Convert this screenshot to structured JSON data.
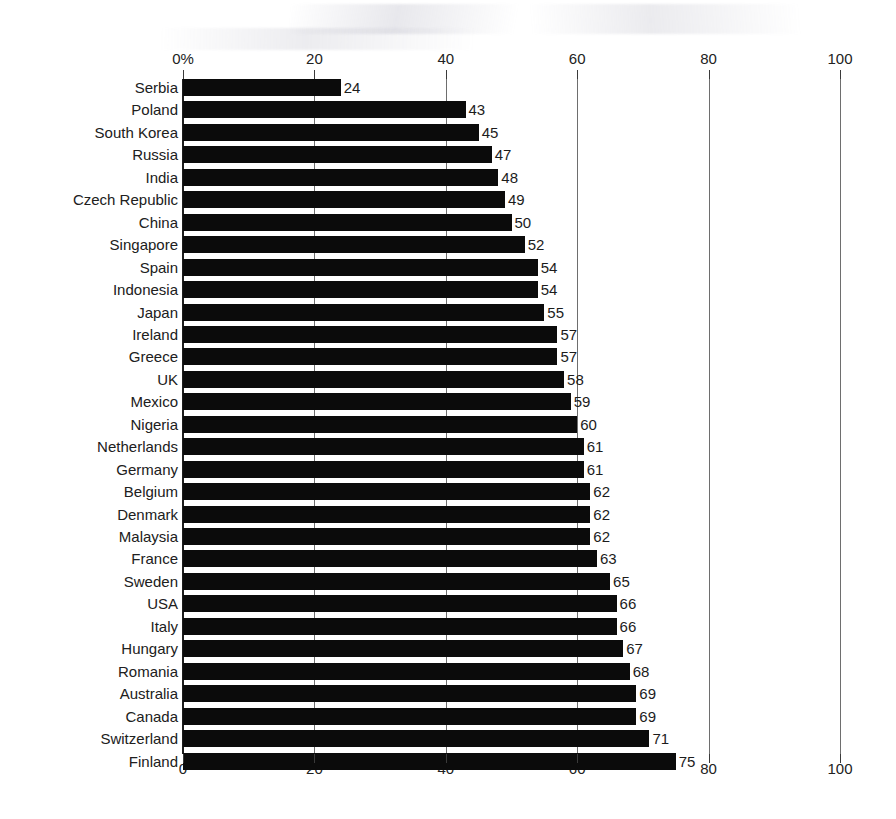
{
  "chart_data": {
    "type": "bar",
    "orientation": "horizontal",
    "title": "",
    "subtitle": "",
    "xlabel": "",
    "ylabel": "",
    "xlim": [
      0,
      100
    ],
    "grid": true,
    "legend": null,
    "axis_top_ticks": [
      "0%",
      "20",
      "40",
      "60",
      "80",
      "100"
    ],
    "axis_bottom_ticks": [
      "0",
      "20",
      "40",
      "60",
      "80",
      "100"
    ],
    "tick_values": [
      0,
      20,
      40,
      60,
      80,
      100
    ],
    "categories": [
      "Serbia",
      "Poland",
      "South Korea",
      "Russia",
      "India",
      "Czech Republic",
      "China",
      "Singapore",
      "Spain",
      "Indonesia",
      "Japan",
      "Ireland",
      "Greece",
      "UK",
      "Mexico",
      "Nigeria",
      "Netherlands",
      "Germany",
      "Belgium",
      "Denmark",
      "Malaysia",
      "France",
      "Sweden",
      "USA",
      "Italy",
      "Hungary",
      "Romania",
      "Australia",
      "Canada",
      "Switzerland",
      "Finland"
    ],
    "values": [
      24,
      43,
      45,
      47,
      48,
      49,
      50,
      52,
      54,
      54,
      55,
      57,
      57,
      58,
      59,
      60,
      61,
      61,
      62,
      62,
      62,
      63,
      65,
      66,
      66,
      67,
      68,
      69,
      69,
      71,
      75
    ],
    "value_labels": [
      "24",
      "43",
      "45",
      "47",
      "48",
      "49",
      "50",
      "52",
      "54",
      "54",
      "55",
      "57",
      "57",
      "58",
      "59",
      "60",
      "61",
      "61",
      "62",
      "62",
      "62",
      "63",
      "65",
      "66",
      "66",
      "67",
      "68",
      "69",
      "69",
      "71",
      "75"
    ],
    "bar_color": "#0b0b0b",
    "background_color": "#ffffff",
    "grid_color": "#6e6e6e"
  }
}
